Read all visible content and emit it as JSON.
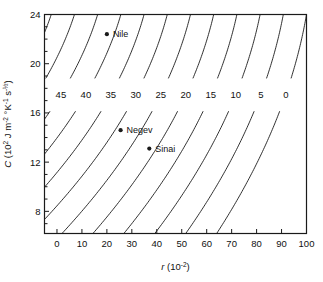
{
  "chart_data": {
    "type": "line",
    "subtype": "contour",
    "title": "",
    "xlabel": "r (10-2)",
    "xlabel_parts": {
      "symbol": "r",
      "open": " (10",
      "exp": "-2",
      "close": ")"
    },
    "ylabel": "C (102 J m-2 °K-1 s-1/2)",
    "ylabel_parts": {
      "symbol": "C",
      "open": " (10",
      "exp1": "2",
      "mid1": " J m",
      "exp2": "-2",
      "mid2": " °K",
      "exp3": "-1",
      "mid3": " s",
      "exp4": "-½",
      "close": ")"
    },
    "xlim": [
      -5,
      100
    ],
    "ylim": [
      6.2,
      24
    ],
    "xticks": [
      0,
      10,
      20,
      30,
      40,
      50,
      60,
      70,
      80,
      90,
      100
    ],
    "yticks": [
      8,
      12,
      16,
      20,
      24
    ],
    "yminorticks": [
      7,
      9,
      10,
      11,
      13,
      14,
      15,
      17,
      18,
      19,
      21,
      22,
      23
    ],
    "grid": false,
    "legend": false,
    "contour_levels": [
      0,
      5,
      10,
      15,
      20,
      25,
      30,
      35,
      40,
      45,
      50,
      55,
      60,
      65,
      70,
      75,
      80,
      85,
      90
    ],
    "labeled_levels": [
      50,
      45,
      40,
      35,
      30,
      25,
      20,
      15,
      10,
      5,
      0
    ],
    "label_row_value": 17.5,
    "label_positions_x": [
      1,
      10,
      20,
      30,
      40,
      50,
      60,
      70,
      80,
      90,
      100
    ],
    "line_color": "#1a1a1a",
    "axis_color": "#1a1a1a",
    "background": "#ffffff",
    "points": [
      {
        "name": "Nile",
        "x": 20.0,
        "y": 22.4,
        "label_dx": 6,
        "label_dy": 3
      },
      {
        "name": "Negev",
        "x": 25.5,
        "y": 14.6,
        "label_dx": 6,
        "label_dy": 3
      },
      {
        "name": "Sinai",
        "x": 37.0,
        "y": 13.1,
        "label_dx": 6,
        "label_dy": 3
      }
    ],
    "annotations": [
      "Nile",
      "Negev",
      "Sinai"
    ]
  }
}
